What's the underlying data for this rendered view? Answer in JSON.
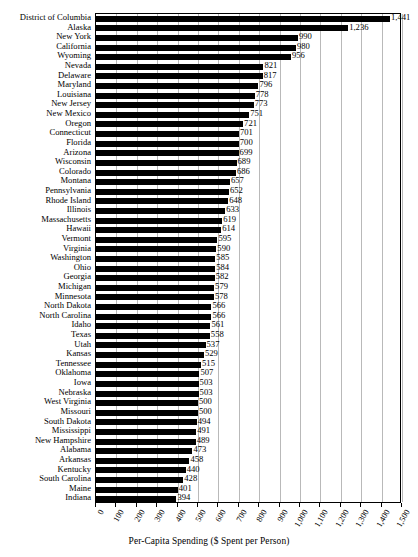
{
  "chart_data": {
    "type": "bar",
    "orientation": "horizontal",
    "title": "",
    "xlabel": "Per-Capita Spending ($ Spent per Person)",
    "ylabel": "",
    "xlim": [
      0,
      1500
    ],
    "xtick_step": 100,
    "grid": true,
    "legend": false,
    "bar_color": "#000000",
    "grid_color": "#b9b9b9",
    "value_labels_shown": true,
    "xticks": [
      "0",
      "100",
      "200",
      "300",
      "400",
      "500",
      "600",
      "700",
      "800",
      "900",
      "1,000",
      "1,100",
      "1,200",
      "1,300",
      "1,400",
      "1,500"
    ],
    "categories": [
      "District of Columbia",
      "Alaska",
      "New York",
      "California",
      "Wyoming",
      "Nevada",
      "Delaware",
      "Maryland",
      "Louisiana",
      "New Jersey",
      "New Mexico",
      "Oregon",
      "Connecticut",
      "Florida",
      "Arizona",
      "Wisconsin",
      "Colorado",
      "Montana",
      "Pennsylvania",
      "Rhode Island",
      "Illinois",
      "Massachusetts",
      "Hawaii",
      "Vermont",
      "Virginia",
      "Washington",
      "Ohio",
      "Georgia",
      "Michigan",
      "Minnesota",
      "North Dakota",
      "North Carolina",
      "Idaho",
      "Texas",
      "Utah",
      "Kansas",
      "Tennessee",
      "Oklahoma",
      "Iowa",
      "Nebraska",
      "West Virginia",
      "Missouri",
      "South Dakota",
      "Mississippi",
      "New Hampshire",
      "Alabama",
      "Arkansas",
      "Kentucky",
      "South Carolina",
      "Maine",
      "Indiana"
    ],
    "values": [
      1441,
      1236,
      990,
      980,
      956,
      821,
      817,
      796,
      778,
      773,
      751,
      721,
      701,
      700,
      699,
      689,
      686,
      657,
      652,
      648,
      633,
      619,
      614,
      595,
      590,
      585,
      584,
      582,
      579,
      578,
      566,
      566,
      561,
      558,
      537,
      529,
      515,
      507,
      503,
      503,
      500,
      500,
      494,
      491,
      489,
      473,
      458,
      440,
      428,
      401,
      394
    ],
    "value_labels": [
      "1,441",
      "1,236",
      "990",
      "980",
      "956",
      "821",
      "817",
      "796",
      "778",
      "773",
      "751",
      "721",
      "701",
      "700",
      "699",
      "689",
      "686",
      "657",
      "652",
      "648",
      "633",
      "619",
      "614",
      "595",
      "590",
      "585",
      "584",
      "582",
      "579",
      "578",
      "566",
      "566",
      "561",
      "558",
      "537",
      "529",
      "515",
      "507",
      "503",
      "503",
      "500",
      "500",
      "494",
      "491",
      "489",
      "473",
      "458",
      "440",
      "428",
      "401",
      "394"
    ]
  }
}
